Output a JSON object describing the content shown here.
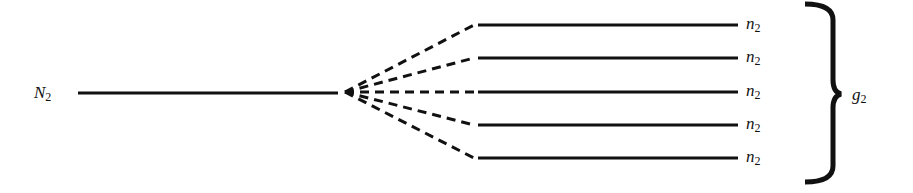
{
  "diagram": {
    "left_level": {
      "label": "N",
      "subscript": "2"
    },
    "right_levels": [
      {
        "label": "n",
        "subscript": "2"
      },
      {
        "label": "n",
        "subscript": "2"
      },
      {
        "label": "n",
        "subscript": "2"
      },
      {
        "label": "n",
        "subscript": "2"
      },
      {
        "label": "n",
        "subscript": "2"
      }
    ],
    "group": {
      "label": "g",
      "subscript": "2"
    },
    "colors": {
      "line": "#111111",
      "background": "#ffffff"
    }
  }
}
